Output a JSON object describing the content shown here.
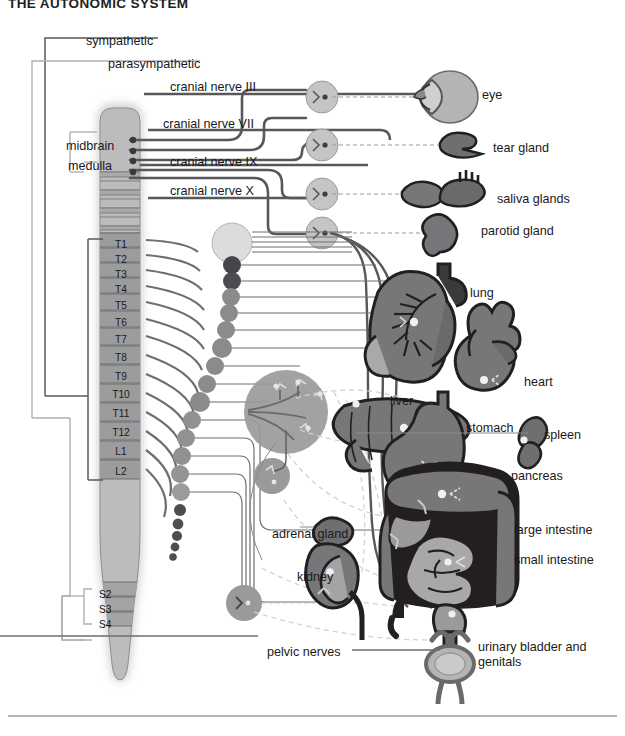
{
  "title": "THE AUTONOMIC SYSTEM",
  "colors": {
    "page_bg": "#ffffff",
    "text": "#1a1a1a",
    "sympathetic_line": "#58585b",
    "parasympathetic_line": "#b0b0b2",
    "cord_fill": "#b9b9bb",
    "cord_segment": "#9a9a9c",
    "cord_glow": "#d9d9db",
    "ganglion_dark": "#58585b",
    "ganglion_mid": "#8e8e90",
    "ganglion_light": "#d5d5d6",
    "organ_dark": "#231f20",
    "organ_mid": "#7a7a7c",
    "organ_light": "#b4b4b6",
    "rule": "#9a9a9c"
  },
  "branch_labels": [
    {
      "id": "sympathetic",
      "text": "sympathetic",
      "x": 86,
      "y": 34
    },
    {
      "id": "parasympathetic",
      "text": "parasympathetic",
      "x": 108,
      "y": 57
    }
  ],
  "cranial_nerves": [
    {
      "id": "cn3",
      "text": "cranial nerve III",
      "x": 170,
      "y": 80
    },
    {
      "id": "cn7",
      "text": "cranial nerve VII",
      "x": 163,
      "y": 117
    },
    {
      "id": "cn9",
      "text": "cranial nerve IX",
      "x": 170,
      "y": 155
    },
    {
      "id": "cn10",
      "text": "cranial nerve X",
      "x": 170,
      "y": 184
    }
  ],
  "brain_labels": [
    {
      "id": "midbrain",
      "text": "midbrain",
      "x": 66,
      "y": 139
    },
    {
      "id": "medulla",
      "text": "medulla",
      "x": 68,
      "y": 159
    }
  ],
  "spinal_segments": [
    {
      "label": "T1",
      "y": 239
    },
    {
      "label": "T2",
      "y": 254
    },
    {
      "label": "T3",
      "y": 269
    },
    {
      "label": "T4",
      "y": 284
    },
    {
      "label": "T5",
      "y": 300
    },
    {
      "label": "T6",
      "y": 317
    },
    {
      "label": "T7",
      "y": 334
    },
    {
      "label": "T8",
      "y": 352
    },
    {
      "label": "T9",
      "y": 371
    },
    {
      "label": "T10",
      "y": 389
    },
    {
      "label": "T11",
      "y": 408
    },
    {
      "label": "T12",
      "y": 427
    },
    {
      "label": "L1",
      "y": 446
    },
    {
      "label": "L2",
      "y": 466
    }
  ],
  "sacral_segments": [
    {
      "label": "S2",
      "y": 589
    },
    {
      "label": "S3",
      "y": 604
    },
    {
      "label": "S4",
      "y": 619
    }
  ],
  "organ_labels": [
    {
      "id": "eye",
      "text": "eye",
      "x": 482,
      "y": 88
    },
    {
      "id": "tear-gland",
      "text": "tear gland",
      "x": 493,
      "y": 141
    },
    {
      "id": "saliva-glands",
      "text": "saliva glands",
      "x": 497,
      "y": 192
    },
    {
      "id": "parotid-gland",
      "text": "parotid gland",
      "x": 481,
      "y": 224
    },
    {
      "id": "lung",
      "text": "lung",
      "x": 470,
      "y": 286
    },
    {
      "id": "heart",
      "text": "heart",
      "x": 524,
      "y": 375
    },
    {
      "id": "liver",
      "text": "liver",
      "x": 390,
      "y": 394
    },
    {
      "id": "stomach",
      "text": "stomach",
      "x": 466,
      "y": 421
    },
    {
      "id": "spleen",
      "text": "spleen",
      "x": 544,
      "y": 428
    },
    {
      "id": "pancreas",
      "text": "pancreas",
      "x": 511,
      "y": 469
    },
    {
      "id": "large-intestine",
      "text": "large intestine",
      "x": 514,
      "y": 523
    },
    {
      "id": "small-intestine",
      "text": "small intestine",
      "x": 514,
      "y": 553
    },
    {
      "id": "adrenal-gland",
      "text": "adrenal gland",
      "x": 272,
      "y": 527
    },
    {
      "id": "kidney",
      "text": "kidney",
      "x": 297,
      "y": 570
    },
    {
      "id": "pelvic-nerves",
      "text": "pelvic nerves",
      "x": 267,
      "y": 645
    }
  ],
  "bladder_label": {
    "id": "urinary-bladder-genitals",
    "line1": "urinary bladder and",
    "line2": "genitals",
    "x": 478,
    "y": 640
  }
}
